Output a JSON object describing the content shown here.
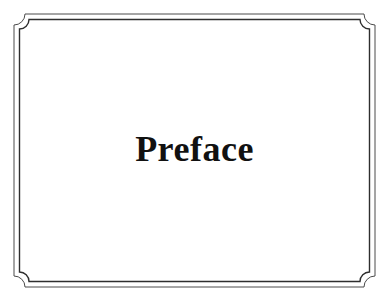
{
  "document": {
    "page_kind": "part-divider-page",
    "background_color": "#ffffff",
    "title": "Preface"
  },
  "border": {
    "name": "double-rule-notched-corner-frame",
    "style": "double-line",
    "line_color": "#4a4a4a",
    "inner_line_color": "#2e2e2e",
    "corner_style": "concave-quarter-circle-notch",
    "outer_rect": {
      "x": 14,
      "y": 14,
      "width": 361,
      "height": 273
    },
    "inner_rect": {
      "x": 19,
      "y": 19,
      "width": 351,
      "height": 263
    },
    "corner_radius": 11,
    "outer_stroke_width": 1,
    "inner_stroke_width": 1.4
  },
  "title": {
    "text": "Preface",
    "color": "#111111",
    "font_size_px": 36,
    "weight": "bold",
    "style": "serif",
    "align": "center",
    "baseline_y": 163,
    "left_x": 133,
    "right_x": 258
  }
}
